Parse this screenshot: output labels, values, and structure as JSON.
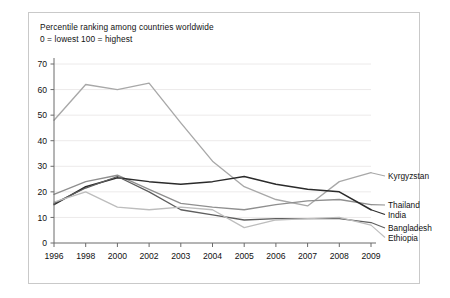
{
  "figure": {
    "caption_line1": "Percentile ranking among countries worldwide",
    "caption_line2": "0 = lowest 100 = highest"
  },
  "chart_data": {
    "type": "line",
    "title": "Percentile ranking among countries worldwide",
    "subtitle": "0 = lowest 100 = highest",
    "xlabel": "",
    "ylabel": "",
    "categories": [
      "1996",
      "1998",
      "2000",
      "2002",
      "2003",
      "2004",
      "2005",
      "2006",
      "2007",
      "2008",
      "2009"
    ],
    "ylim": [
      0,
      70
    ],
    "yticks": [
      0,
      10,
      20,
      30,
      40,
      50,
      60,
      70
    ],
    "grid": true,
    "legend_position": "right-direct-labels",
    "series": [
      {
        "name": "Kyrgyzstan",
        "color": "#a8a8a8",
        "width": 1.35,
        "values": [
          48,
          62,
          60,
          62.5,
          47,
          32,
          22,
          17,
          14.5,
          24,
          27.5
        ]
      },
      {
        "name": "Thailand",
        "color": "#8f8f8f",
        "width": 1.35,
        "values": [
          19,
          24,
          26.5,
          21,
          15.5,
          14,
          13,
          15,
          16.5,
          17,
          15
        ]
      },
      {
        "name": "India",
        "color": "#2b2b2b",
        "width": 1.5,
        "values": [
          15,
          22,
          25.5,
          24,
          23,
          24,
          26,
          23,
          21,
          20,
          13
        ]
      },
      {
        "name": "Bangladesh",
        "color": "#5e5e5e",
        "width": 1.3,
        "values": [
          15.5,
          21.5,
          26,
          20,
          13,
          11,
          9,
          9.5,
          9.5,
          9.5,
          8
        ]
      },
      {
        "name": "Ethiopia",
        "color": "#bdbdbd",
        "width": 1.3,
        "values": [
          16,
          20,
          14,
          13,
          14,
          13,
          6,
          9,
          9.5,
          10,
          7
        ]
      }
    ]
  }
}
